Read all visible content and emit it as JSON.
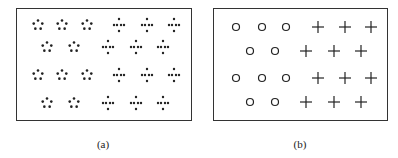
{
  "panels": [
    {
      "id": "a",
      "caption": "(a)",
      "box": {
        "x": 16,
        "y": 8,
        "w": 176,
        "h": 113
      },
      "caption_pos": {
        "x": 103,
        "y": 138
      },
      "groups": [
        {
          "shape": "dot-pentagon",
          "points": [
            [
              38,
              25
            ],
            [
              62,
              25
            ],
            [
              87,
              25
            ],
            [
              47,
              47
            ],
            [
              74,
              47
            ],
            [
              38,
              75
            ],
            [
              62,
              75
            ],
            [
              87,
              75
            ],
            [
              47,
              103
            ],
            [
              74,
              103
            ]
          ]
        },
        {
          "shape": "dot-cross",
          "points": [
            [
              119,
              25
            ],
            [
              147,
              25
            ],
            [
              174,
              25
            ],
            [
              108,
              47
            ],
            [
              136,
              47
            ],
            [
              163,
              47
            ],
            [
              119,
              75
            ],
            [
              147,
              75
            ],
            [
              174,
              75
            ],
            [
              108,
              103
            ],
            [
              136,
              103
            ],
            [
              163,
              103
            ]
          ]
        }
      ]
    },
    {
      "id": "b",
      "caption": "(b)",
      "box": {
        "x": 213,
        "y": 8,
        "w": 175,
        "h": 113
      },
      "caption_pos": {
        "x": 300,
        "y": 138
      },
      "groups": [
        {
          "shape": "circle",
          "points": [
            [
              236,
              27
            ],
            [
              262,
              27
            ],
            [
              286,
              27
            ],
            [
              250,
              51
            ],
            [
              275,
              51
            ],
            [
              236,
              78
            ],
            [
              262,
              78
            ],
            [
              286,
              78
            ],
            [
              250,
              102
            ],
            [
              275,
              102
            ]
          ]
        },
        {
          "shape": "plus",
          "points": [
            [
              318,
              27
            ],
            [
              345,
              27
            ],
            [
              371,
              27
            ],
            [
              306,
              51
            ],
            [
              334,
              51
            ],
            [
              361,
              51
            ],
            [
              318,
              78
            ],
            [
              345,
              78
            ],
            [
              371,
              78
            ],
            [
              306,
              102
            ],
            [
              334,
              102
            ],
            [
              361,
              102
            ]
          ]
        }
      ]
    }
  ],
  "colors": {
    "stroke": "#222222",
    "frame": "#333333"
  }
}
